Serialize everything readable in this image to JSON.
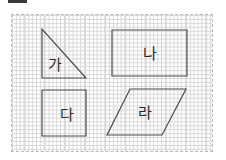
{
  "canvas": {
    "width": 226,
    "height": 160,
    "background": "#ffffff"
  },
  "artifact": {
    "name": "crop-bar",
    "color": "#3a3a3a"
  },
  "grid": {
    "border_color": "#b9b9b9",
    "line_color": "#cfcfcf",
    "cell_width": 20.2,
    "cell_height": 19.7,
    "columns": 10,
    "rows": 7,
    "left": 11,
    "top": 14,
    "width": 202,
    "height": 138
  },
  "shapes": [
    {
      "id": "triangle",
      "label": "가",
      "type": "right-triangle",
      "stroke": "#4d4d4d",
      "stroke_width": 1.2,
      "points": "42,29 42,78 86,78",
      "label_x": 55,
      "label_y": 65
    },
    {
      "id": "rectangle",
      "label": "나",
      "type": "rectangle",
      "stroke": "#4d4d4d",
      "stroke_width": 1.2,
      "points": "112,30 187,30 187,76 112,76",
      "label_x": 150,
      "label_y": 54
    },
    {
      "id": "square",
      "label": "다",
      "type": "square",
      "stroke": "#4d4d4d",
      "stroke_width": 1.2,
      "points": "42,90 86,90 86,136 42,136",
      "label_x": 67,
      "label_y": 115
    },
    {
      "id": "parallelogram",
      "label": "라",
      "type": "parallelogram",
      "stroke": "#4d4d4d",
      "stroke_width": 1.2,
      "points": "130,89 186,89 162,135 107,135",
      "label_x": 145,
      "label_y": 113
    }
  ]
}
